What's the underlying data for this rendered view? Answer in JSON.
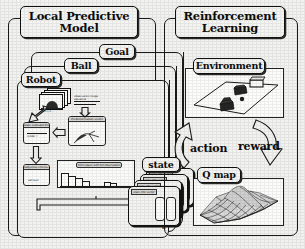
{
  "figure": {
    "kind": "block-diagram",
    "background_color": "#f2f2f0",
    "line_color": "#1a1a1a"
  },
  "left_panel": {
    "title": "Local Predictive Model",
    "title_line1": "Local Predictive",
    "title_line2": "Model",
    "nested_modules": [
      {
        "label": "Goal"
      },
      {
        "label": "Ball"
      },
      {
        "label": "Robot"
      }
    ],
    "robot_internals": {
      "image_stack_note": "Observation image sequence",
      "predictor_label": "Predicted feature vector",
      "state_estimator_label": "State estimator Prediction error model",
      "output_label": "Subjective criteria self-eval",
      "histogram_label": "Error space with full observation"
    }
  },
  "state_stack": {
    "label": "state",
    "count_label": "n",
    "cards": [
      {
        "title": "state info vector"
      },
      {
        "title": "state info vector"
      },
      {
        "title": "state info vector"
      },
      {
        "title": "state info vector"
      }
    ]
  },
  "right_panel": {
    "title": "Reinforcement Learning",
    "title_line1": "Reinforcement",
    "title_line2": "Learning",
    "environment": {
      "label": "Environment",
      "scene": "soccer field with robot, ball and goal"
    },
    "q_map": {
      "label": "Q map",
      "plot_type": "3d-surface",
      "description": "mesh surface with single peak"
    },
    "arrows": [
      {
        "label": "action",
        "direction": "up",
        "from": "q-map",
        "to": "environment"
      },
      {
        "label": "reward",
        "direction": "down",
        "from": "environment",
        "to": "q-map"
      }
    ]
  },
  "icons": {
    "block_arrow_right": "block-arrow-right-icon",
    "block_arrow_up": "block-arrow-up-icon",
    "block_arrow_down": "block-arrow-down-icon",
    "curved_arrow_up": "curved-block-arrow-up-icon",
    "curved_arrow_down": "curved-block-arrow-down-icon"
  }
}
